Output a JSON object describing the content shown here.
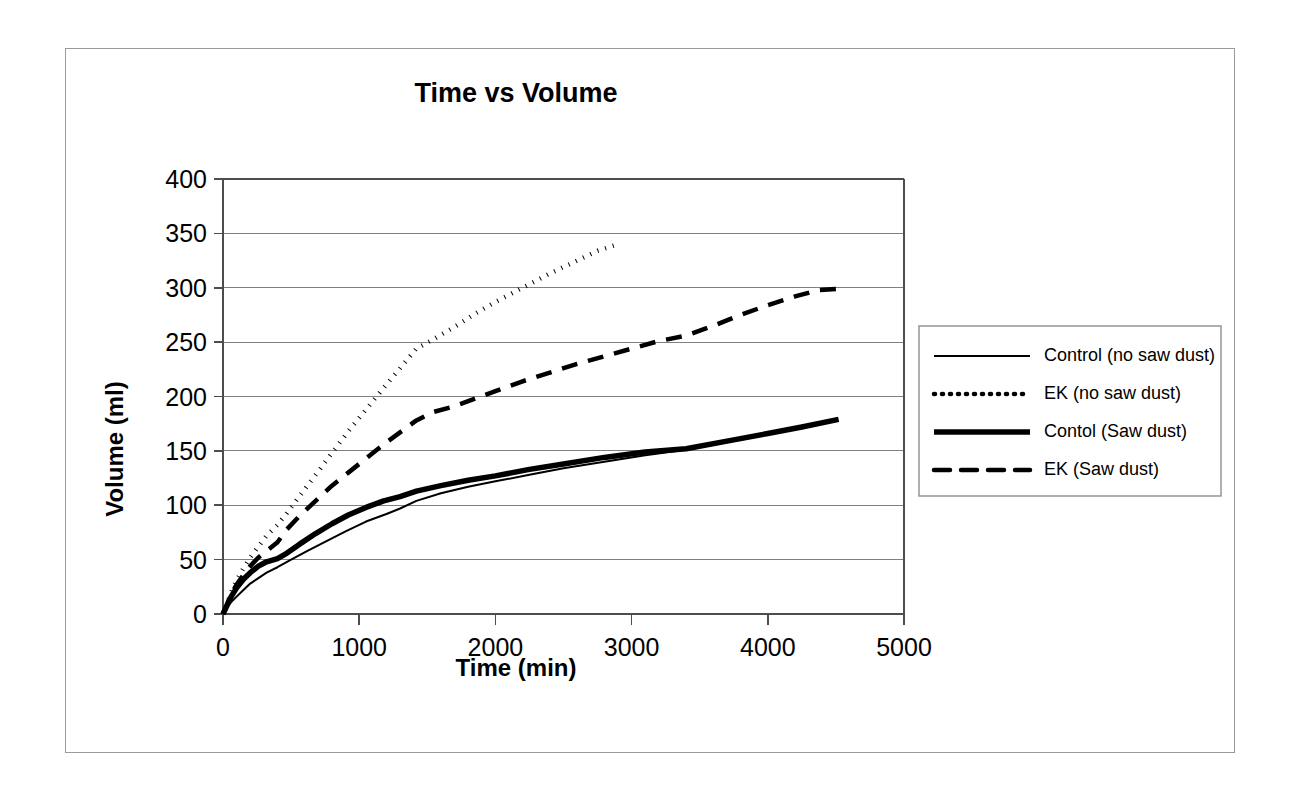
{
  "chart_data": {
    "type": "line",
    "title": "Time vs Volume",
    "xlabel": "Time (min)",
    "ylabel": "Volume (ml)",
    "xlim": [
      0,
      5000
    ],
    "ylim": [
      0,
      400
    ],
    "xticks": [
      "0",
      "1000",
      "2000",
      "3000",
      "4000",
      "5000"
    ],
    "yticks": [
      "0",
      "50",
      "100",
      "150",
      "200",
      "250",
      "300",
      "350",
      "400"
    ],
    "grid": "horizontal",
    "legend_position": "right-outside",
    "series": [
      {
        "name": "Control (no saw dust)",
        "style": "solid-thin",
        "points": [
          [
            0,
            0
          ],
          [
            30,
            6
          ],
          [
            60,
            11
          ],
          [
            100,
            16
          ],
          [
            150,
            22
          ],
          [
            200,
            28
          ],
          [
            260,
            33
          ],
          [
            320,
            38
          ],
          [
            400,
            43
          ],
          [
            500,
            50
          ],
          [
            620,
            58
          ],
          [
            760,
            67
          ],
          [
            900,
            76
          ],
          [
            1050,
            85
          ],
          [
            1200,
            92
          ],
          [
            1300,
            97
          ],
          [
            1420,
            104
          ],
          [
            1600,
            111
          ],
          [
            1800,
            117
          ],
          [
            2000,
            122
          ],
          [
            2250,
            128
          ],
          [
            2500,
            134
          ],
          [
            2800,
            140
          ],
          [
            3100,
            146
          ],
          [
            3400,
            151
          ],
          [
            3700,
            158
          ],
          [
            4000,
            165
          ],
          [
            4250,
            171
          ],
          [
            4500,
            178
          ]
        ]
      },
      {
        "name": "EK (no saw dust)",
        "style": "dotted",
        "points": [
          [
            0,
            0
          ],
          [
            30,
            10
          ],
          [
            60,
            20
          ],
          [
            100,
            31
          ],
          [
            150,
            42
          ],
          [
            200,
            52
          ],
          [
            260,
            62
          ],
          [
            320,
            72
          ],
          [
            400,
            82
          ],
          [
            470,
            93
          ],
          [
            560,
            108
          ],
          [
            680,
            128
          ],
          [
            800,
            148
          ],
          [
            920,
            168
          ],
          [
            1050,
            188
          ],
          [
            1180,
            208
          ],
          [
            1300,
            226
          ],
          [
            1420,
            244
          ],
          [
            1550,
            253
          ],
          [
            1700,
            264
          ],
          [
            1850,
            276
          ],
          [
            2000,
            287
          ],
          [
            2200,
            300
          ],
          [
            2400,
            313
          ],
          [
            2600,
            325
          ],
          [
            2750,
            334
          ],
          [
            2900,
            340
          ]
        ]
      },
      {
        "name": "Contol (Saw dust)",
        "style": "solid-thick",
        "points": [
          [
            0,
            0
          ],
          [
            30,
            8
          ],
          [
            60,
            16
          ],
          [
            100,
            24
          ],
          [
            150,
            32
          ],
          [
            200,
            38
          ],
          [
            260,
            44
          ],
          [
            320,
            48
          ],
          [
            400,
            51
          ],
          [
            470,
            56
          ],
          [
            560,
            64
          ],
          [
            680,
            74
          ],
          [
            800,
            83
          ],
          [
            920,
            91
          ],
          [
            1050,
            98
          ],
          [
            1180,
            104
          ],
          [
            1300,
            108
          ],
          [
            1420,
            113
          ],
          [
            1600,
            118
          ],
          [
            1800,
            123
          ],
          [
            2000,
            127
          ],
          [
            2250,
            133
          ],
          [
            2500,
            138
          ],
          [
            2800,
            144
          ],
          [
            3100,
            149
          ],
          [
            3400,
            152
          ],
          [
            3700,
            159
          ],
          [
            4000,
            166
          ],
          [
            4250,
            172
          ],
          [
            4520,
            179
          ]
        ]
      },
      {
        "name": "EK (Saw dust)",
        "style": "dashed",
        "points": [
          [
            0,
            0
          ],
          [
            30,
            9
          ],
          [
            60,
            18
          ],
          [
            100,
            27
          ],
          [
            150,
            36
          ],
          [
            200,
            44
          ],
          [
            260,
            52
          ],
          [
            320,
            58
          ],
          [
            400,
            66
          ],
          [
            470,
            78
          ],
          [
            560,
            90
          ],
          [
            680,
            104
          ],
          [
            800,
            118
          ],
          [
            920,
            130
          ],
          [
            1050,
            143
          ],
          [
            1180,
            156
          ],
          [
            1300,
            167
          ],
          [
            1420,
            178
          ],
          [
            1550,
            186
          ],
          [
            1700,
            191
          ],
          [
            1850,
            198
          ],
          [
            2000,
            205
          ],
          [
            2200,
            214
          ],
          [
            2400,
            222
          ],
          [
            2600,
            230
          ],
          [
            2800,
            237
          ],
          [
            3000,
            244
          ],
          [
            3200,
            251
          ],
          [
            3400,
            256
          ],
          [
            3600,
            265
          ],
          [
            3800,
            275
          ],
          [
            4000,
            284
          ],
          [
            4200,
            292
          ],
          [
            4380,
            298
          ],
          [
            4510,
            299
          ]
        ]
      }
    ]
  },
  "legend": {
    "items": [
      {
        "label": "Control (no saw dust)",
        "swatch": "solid-thin-swatch"
      },
      {
        "label": "EK (no saw dust)",
        "swatch": "dotted-swatch"
      },
      {
        "label": "Contol (Saw dust)",
        "swatch": "solid-thick-swatch"
      },
      {
        "label": "EK (Saw dust)",
        "swatch": "dashed-swatch"
      }
    ]
  },
  "colors": {
    "foreground": "#000000",
    "gridline": "#808080",
    "frame": "#9a9a9a",
    "background": "#ffffff"
  }
}
